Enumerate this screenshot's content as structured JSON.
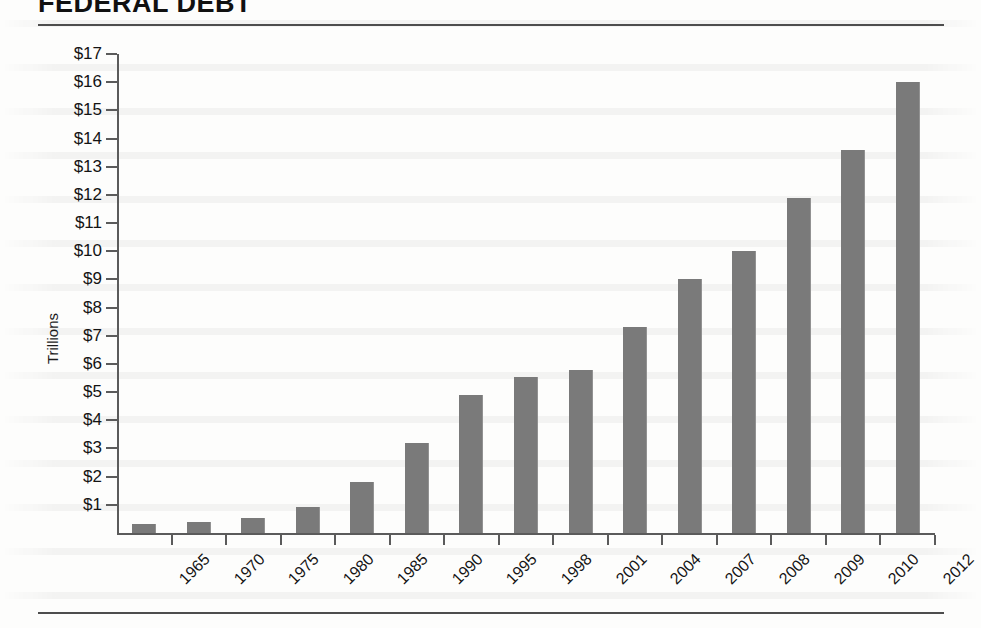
{
  "document": {
    "title": "FEDERAL DEBT"
  },
  "chart_data": {
    "type": "bar",
    "title": "FEDERAL DEBT",
    "xlabel": "",
    "ylabel": "Trillions",
    "ylim": [
      0,
      17
    ],
    "ytick_step": 1,
    "ytick_labels": [
      "$1",
      "$2",
      "$3",
      "$4",
      "$5",
      "$6",
      "$7",
      "$8",
      "$9",
      "$10",
      "$11",
      "$12",
      "$13",
      "$14",
      "$15",
      "$16",
      "$17"
    ],
    "ytick_values": [
      1,
      2,
      3,
      4,
      5,
      6,
      7,
      8,
      9,
      10,
      11,
      12,
      13,
      14,
      15,
      16,
      17
    ],
    "grid": false,
    "legend": false,
    "bar_color": "#7a7a7a",
    "axis_color": "#5b5b5b",
    "categories": [
      "1965",
      "1970",
      "1975",
      "1980",
      "1985",
      "1990",
      "1995",
      "1998",
      "2001",
      "2004",
      "2007",
      "2008",
      "2009",
      "2010",
      "2012"
    ],
    "values": [
      0.32,
      0.38,
      0.54,
      0.91,
      1.8,
      3.2,
      4.9,
      5.55,
      5.8,
      7.3,
      9.0,
      10.0,
      11.9,
      13.6,
      16.0
    ],
    "units": "trillions of dollars"
  }
}
